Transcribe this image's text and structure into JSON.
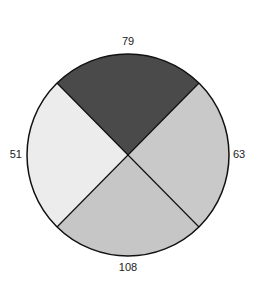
{
  "chart_data": {
    "type": "pie",
    "title": "",
    "categories": [
      "top",
      "right",
      "bottom",
      "left"
    ],
    "values": [
      79,
      63,
      108,
      51
    ],
    "labels": [
      "79",
      "63",
      "108",
      "51"
    ],
    "colors": [
      "#4a4a4a",
      "#c9c9c9",
      "#c6c6c6",
      "#ececec"
    ],
    "note": "Slices drawn as four equal quadrants regardless of values"
  }
}
